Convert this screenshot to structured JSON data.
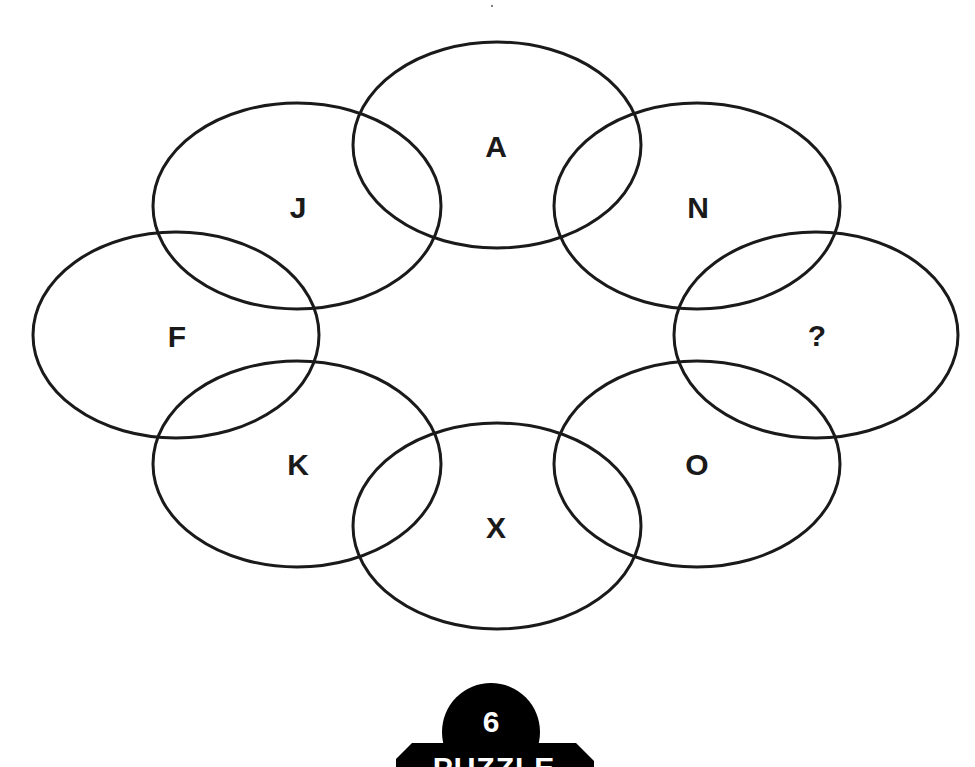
{
  "puzzle": {
    "title": "Letter ring puzzle",
    "ellipses": [
      {
        "id": "top",
        "label": "A",
        "cx": 497,
        "cy": 145,
        "rx": 144,
        "ry": 103
      },
      {
        "id": "upper-right",
        "label": "N",
        "cx": 697,
        "cy": 206,
        "rx": 143,
        "ry": 103
      },
      {
        "id": "right",
        "label": "?",
        "cx": 816,
        "cy": 335,
        "rx": 142,
        "ry": 103
      },
      {
        "id": "lower-right",
        "label": "O",
        "cx": 697,
        "cy": 464,
        "rx": 143,
        "ry": 103
      },
      {
        "id": "bottom",
        "label": "X",
        "cx": 497,
        "cy": 526,
        "rx": 144,
        "ry": 103
      },
      {
        "id": "lower-left",
        "label": "K",
        "cx": 297,
        "cy": 464,
        "rx": 144,
        "ry": 103
      },
      {
        "id": "left",
        "label": "F",
        "cx": 176,
        "cy": 335,
        "rx": 143,
        "ry": 103
      },
      {
        "id": "upper-left",
        "label": "J",
        "cx": 297,
        "cy": 206,
        "rx": 144,
        "ry": 103
      }
    ],
    "letter_positions": [
      {
        "label": "A",
        "x": 496,
        "y": 147
      },
      {
        "label": "N",
        "x": 698,
        "y": 208
      },
      {
        "label": "?",
        "x": 817,
        "y": 336
      },
      {
        "label": "O",
        "x": 697,
        "y": 465
      },
      {
        "label": "X",
        "x": 496,
        "y": 528
      },
      {
        "label": "K",
        "x": 298,
        "y": 465
      },
      {
        "label": "F",
        "x": 177,
        "y": 337
      },
      {
        "label": "J",
        "x": 298,
        "y": 208
      }
    ]
  },
  "badge": {
    "number": "6",
    "label": "PUZZLE",
    "color": "#000000",
    "text_color": "#ffffff"
  },
  "colors": {
    "stroke": "#1a1a1a",
    "background": "#ffffff"
  }
}
